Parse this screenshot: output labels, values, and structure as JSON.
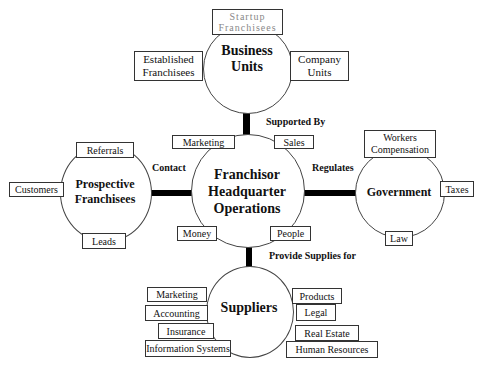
{
  "diagram": {
    "center": {
      "title": "Franchisor Headquarter Operations",
      "title_lines": [
        "Franchisor",
        "Headquarter",
        "Operations"
      ],
      "boxes": [
        "Marketing",
        "Sales",
        "Money",
        "People"
      ]
    },
    "business_units": {
      "title_lines": [
        "Business",
        "Units"
      ],
      "boxes": {
        "top": [
          "Startup",
          "Franchisees"
        ],
        "left": [
          "Established",
          "Franchisees"
        ],
        "right": [
          "Company",
          "Units"
        ]
      },
      "connector_label": "Supported By"
    },
    "prospective_franchisees": {
      "title_lines": [
        "Prospective",
        "Franchisees"
      ],
      "boxes": [
        "Referrals",
        "Customers",
        "Leads"
      ],
      "connector_label": "Contact"
    },
    "government": {
      "title": "Government",
      "boxes": {
        "top": [
          "Workers",
          "Compensation"
        ],
        "right": "Taxes",
        "bottom": "Law"
      },
      "connector_label": "Regulates"
    },
    "suppliers": {
      "title": "Suppliers",
      "connector_label": "Provide Supplies for",
      "left_boxes": [
        "Marketing",
        "Accounting",
        "Insurance",
        "Information Systems"
      ],
      "right_boxes": [
        "Products",
        "Legal",
        "Real Estate",
        "Human Resources"
      ]
    }
  }
}
